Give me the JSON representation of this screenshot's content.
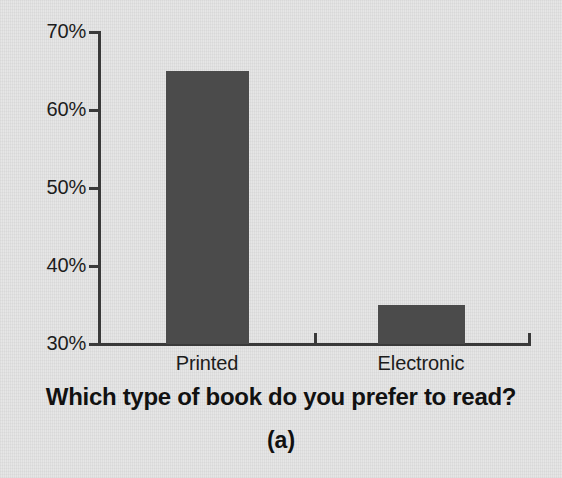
{
  "chart_data": {
    "type": "bar",
    "title": "",
    "xlabel": "Which type of book do you prefer to read?",
    "ylabel": "",
    "categories": [
      "Printed",
      "Electronic"
    ],
    "values": [
      65,
      35
    ],
    "value_labels": [
      "65%",
      "35%"
    ],
    "ylim": [
      30,
      70
    ],
    "yticks": [
      30,
      40,
      50,
      60,
      70
    ],
    "ytick_labels": [
      "30%",
      "40%",
      "50%",
      "60%",
      "70%"
    ],
    "grid": false,
    "legend": null,
    "legend_position": "none",
    "bar_color": "#4b4b4b",
    "axis_color": "#3a3a3a",
    "background_color": "#e4e4e4",
    "text_color": "#1c1c1c",
    "annotations": [
      "(a)"
    ]
  },
  "figure": {
    "panel_caption": "(a)",
    "axis_title": "Which type of book do you prefer to read?",
    "ytick_labels": [
      "70%",
      "60%",
      "50%",
      "40%",
      "30%"
    ],
    "category_labels": [
      "Printed",
      "Electronic"
    ]
  }
}
